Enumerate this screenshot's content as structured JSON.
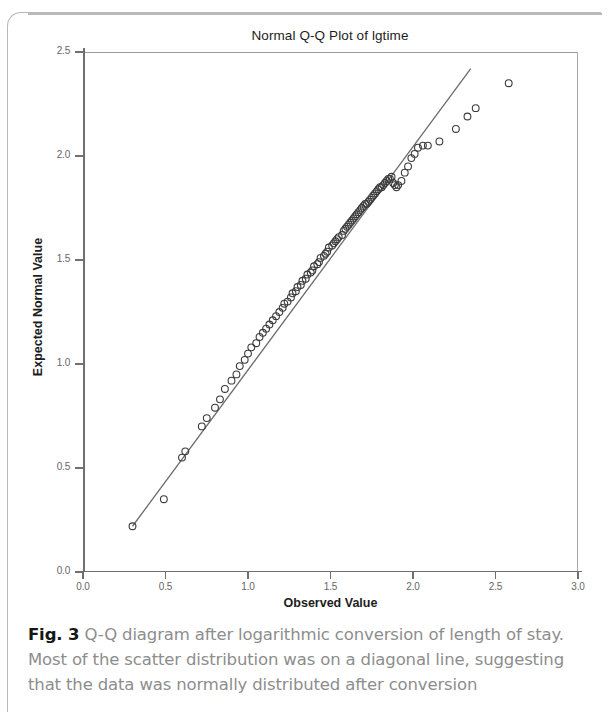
{
  "figure": {
    "label": "Fig. 3",
    "caption": "Q-Q diagram after logarithmic conversion of length of stay. Most of the scatter distribution was on a diagonal line, suggesting that the data was normally distributed after conversion"
  },
  "chart_data": {
    "type": "scatter",
    "title": "Normal Q-Q Plot of lgtime",
    "xlabel": "Observed Value",
    "ylabel": "Expected Normal Value",
    "xlim": [
      0.0,
      3.0
    ],
    "ylim": [
      0.0,
      2.5
    ],
    "xticks": [
      "0.0",
      "0.5",
      "1.0",
      "1.5",
      "2.0",
      "2.5",
      "3.0"
    ],
    "yticks": [
      "0.0",
      "0.5",
      "1.0",
      "1.5",
      "2.0",
      "2.5"
    ],
    "grid": false,
    "legend": null,
    "marker": "open-circle",
    "marker_color": "#3a3a3a",
    "line_color": "#6b6b6b",
    "reference_line": {
      "label": "normal reference line",
      "x": [
        0.3,
        2.35
      ],
      "y": [
        0.22,
        2.42
      ]
    },
    "series": [
      {
        "name": "lgtime quantiles",
        "points": [
          [
            0.3,
            0.22
          ],
          [
            0.49,
            0.35
          ],
          [
            0.6,
            0.55
          ],
          [
            0.62,
            0.58
          ],
          [
            0.72,
            0.7
          ],
          [
            0.75,
            0.74
          ],
          [
            0.8,
            0.79
          ],
          [
            0.83,
            0.83
          ],
          [
            0.86,
            0.88
          ],
          [
            0.9,
            0.92
          ],
          [
            0.93,
            0.95
          ],
          [
            0.95,
            0.99
          ],
          [
            0.98,
            1.02
          ],
          [
            1.0,
            1.05
          ],
          [
            1.02,
            1.08
          ],
          [
            1.05,
            1.1
          ],
          [
            1.07,
            1.13
          ],
          [
            1.09,
            1.15
          ],
          [
            1.11,
            1.17
          ],
          [
            1.13,
            1.19
          ],
          [
            1.15,
            1.21
          ],
          [
            1.17,
            1.23
          ],
          [
            1.19,
            1.25
          ],
          [
            1.21,
            1.27
          ],
          [
            1.22,
            1.29
          ],
          [
            1.24,
            1.3
          ],
          [
            1.26,
            1.32
          ],
          [
            1.27,
            1.34
          ],
          [
            1.29,
            1.35
          ],
          [
            1.3,
            1.37
          ],
          [
            1.32,
            1.38
          ],
          [
            1.33,
            1.4
          ],
          [
            1.35,
            1.41
          ],
          [
            1.36,
            1.43
          ],
          [
            1.38,
            1.44
          ],
          [
            1.39,
            1.45
          ],
          [
            1.4,
            1.47
          ],
          [
            1.42,
            1.48
          ],
          [
            1.43,
            1.49
          ],
          [
            1.44,
            1.51
          ],
          [
            1.46,
            1.52
          ],
          [
            1.47,
            1.53
          ],
          [
            1.48,
            1.54
          ],
          [
            1.49,
            1.56
          ],
          [
            1.51,
            1.57
          ],
          [
            1.52,
            1.58
          ],
          [
            1.53,
            1.59
          ],
          [
            1.54,
            1.6
          ],
          [
            1.55,
            1.61
          ],
          [
            1.57,
            1.62
          ],
          [
            1.58,
            1.64
          ],
          [
            1.59,
            1.65
          ],
          [
            1.6,
            1.66
          ],
          [
            1.61,
            1.67
          ],
          [
            1.62,
            1.68
          ],
          [
            1.63,
            1.69
          ],
          [
            1.64,
            1.7
          ],
          [
            1.65,
            1.71
          ],
          [
            1.66,
            1.72
          ],
          [
            1.67,
            1.73
          ],
          [
            1.68,
            1.74
          ],
          [
            1.69,
            1.75
          ],
          [
            1.7,
            1.76
          ],
          [
            1.71,
            1.77
          ],
          [
            1.72,
            1.77
          ],
          [
            1.73,
            1.78
          ],
          [
            1.74,
            1.79
          ],
          [
            1.75,
            1.8
          ],
          [
            1.76,
            1.81
          ],
          [
            1.77,
            1.82
          ],
          [
            1.78,
            1.83
          ],
          [
            1.79,
            1.84
          ],
          [
            1.8,
            1.85
          ],
          [
            1.81,
            1.85
          ],
          [
            1.82,
            1.86
          ],
          [
            1.83,
            1.87
          ],
          [
            1.84,
            1.88
          ],
          [
            1.85,
            1.89
          ],
          [
            1.86,
            1.89
          ],
          [
            1.87,
            1.9
          ],
          [
            1.88,
            1.87
          ],
          [
            1.89,
            1.86
          ],
          [
            1.9,
            1.85
          ],
          [
            1.91,
            1.86
          ],
          [
            1.93,
            1.88
          ],
          [
            1.95,
            1.92
          ],
          [
            1.97,
            1.95
          ],
          [
            1.99,
            1.99
          ],
          [
            2.01,
            2.01
          ],
          [
            2.03,
            2.04
          ],
          [
            2.06,
            2.05
          ],
          [
            2.09,
            2.05
          ],
          [
            2.16,
            2.07
          ],
          [
            2.26,
            2.13
          ],
          [
            2.33,
            2.19
          ],
          [
            2.38,
            2.23
          ],
          [
            2.58,
            2.35
          ]
        ]
      }
    ]
  }
}
